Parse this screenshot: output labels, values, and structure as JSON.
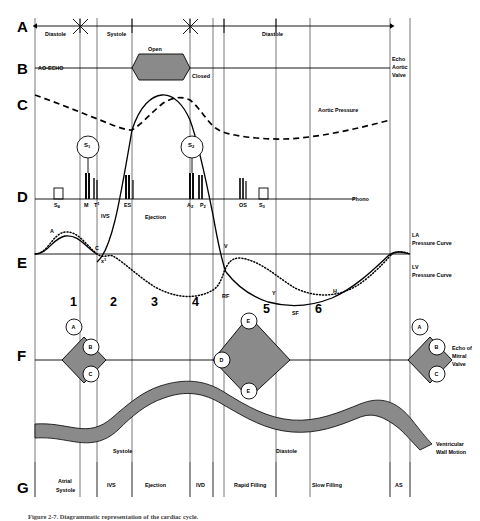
{
  "figure": {
    "caption": "Figure 2-7.  Diagrammatic representation of the cardiac cycle."
  },
  "colors": {
    "line": "#000000",
    "grid": "#555555",
    "fill_gray": "#8a8a8a",
    "fill_band": "#8a8a8a",
    "background": "#ffffff"
  },
  "row_letters": [
    {
      "letter": "A",
      "y": 26
    },
    {
      "letter": "B",
      "y": 68
    },
    {
      "letter": "C",
      "y": 104
    },
    {
      "letter": "D",
      "y": 196
    },
    {
      "letter": "E",
      "y": 262
    },
    {
      "letter": "F",
      "y": 355
    },
    {
      "letter": "G",
      "y": 487
    }
  ],
  "row_a": {
    "name": "timing-bar",
    "segments": [
      {
        "label": "Diastole",
        "x": 45
      },
      {
        "label": "Systole",
        "x": 107
      },
      {
        "label": "Diastole",
        "x": 262
      }
    ]
  },
  "row_b": {
    "left_label": "AO-ECHO",
    "valve_open_label": "Open",
    "valve_closed_label": "Closed",
    "right_label_lines": [
      "Echo",
      "Aortic",
      "Valve"
    ]
  },
  "row_c": {
    "aortic_pressure_label": "Aortic Pressure"
  },
  "row_d": {
    "phono_label": "Phono",
    "heart_sounds": [
      {
        "id": "s1",
        "label": "S",
        "subscript": "1"
      },
      {
        "id": "s2",
        "label": "S",
        "subscript": "2"
      }
    ],
    "markers": [
      {
        "label": "S",
        "subscript": "4",
        "x": 57
      },
      {
        "label": "M",
        "subscript": "",
        "x": 88
      },
      {
        "label": "T",
        "superscript": "1",
        "x": 98
      },
      {
        "label": "ES",
        "subscript": "",
        "x": 128
      },
      {
        "label": "A",
        "subscript": "2",
        "x": 192
      },
      {
        "label": "P",
        "subscript": "2",
        "x": 206
      },
      {
        "label": "OS",
        "subscript": "",
        "x": 243
      },
      {
        "label": "S",
        "subscript": "3",
        "x": 263
      }
    ]
  },
  "row_e": {
    "wave_labels": [
      {
        "label": "A",
        "x": 50,
        "y": 228
      },
      {
        "label": "C",
        "x": 95,
        "y": 245
      },
      {
        "label": "x",
        "superscript": "1",
        "x": 103,
        "y": 258
      },
      {
        "label": "V",
        "x": 224,
        "y": 244
      },
      {
        "label": "Y",
        "x": 272,
        "y": 290
      },
      {
        "label": "H",
        "x": 333,
        "y": 288
      }
    ],
    "right_labels": [
      {
        "lines": [
          "LA",
          "Pressure Curve"
        ],
        "y": 232
      },
      {
        "lines": [
          "LV",
          "Pressure Curve"
        ],
        "y": 262
      }
    ]
  },
  "row_f": {
    "phases": [
      {
        "number": "1",
        "x": 72,
        "y": 302
      },
      {
        "number": "2",
        "x": 112,
        "y": 302
      },
      {
        "number": "3",
        "x": 153,
        "y": 302
      },
      {
        "number": "4",
        "x": 194,
        "y": 302
      },
      {
        "number": "5",
        "x": 265,
        "y": 308
      },
      {
        "number": "6",
        "x": 317,
        "y": 308
      }
    ],
    "filling_labels": [
      {
        "label": "RF",
        "x": 224,
        "y": 295
      },
      {
        "label": "SF",
        "x": 294,
        "y": 312
      }
    ],
    "valve_points_left": [
      {
        "label": "A",
        "cx": 74,
        "cy": 327
      },
      {
        "label": "B",
        "cx": 91,
        "cy": 347
      },
      {
        "label": "C",
        "cx": 91,
        "cy": 374
      }
    ],
    "valve_points_mid": [
      {
        "label": "D",
        "cx": 222,
        "cy": 360
      },
      {
        "label": "E",
        "cx": 249,
        "cy": 321
      },
      {
        "label": "E",
        "cx": 249,
        "cy": 391
      }
    ],
    "valve_points_right": [
      {
        "label": "A",
        "cx": 420,
        "cy": 327
      },
      {
        "label": "B",
        "cx": 437,
        "cy": 347
      },
      {
        "label": "C",
        "cx": 437,
        "cy": 374
      }
    ],
    "right_label_lines": [
      "Echo of",
      "Mitral",
      "Valve"
    ]
  },
  "row_g": {
    "inner_labels": [
      {
        "label": "Systole",
        "x": 118,
        "y": 452
      },
      {
        "label": "Diastole",
        "x": 280,
        "y": 452
      }
    ],
    "right_label_lines": [
      "Ventricular",
      "Wall Motion"
    ],
    "bottom_labels": [
      {
        "lines": [
          "Atrial",
          "Systole"
        ],
        "x": 67
      },
      {
        "lines": [
          "IVS"
        ],
        "x": 110
      },
      {
        "lines": [
          "Ejection"
        ],
        "x": 155
      },
      {
        "lines": [
          "IVD"
        ],
        "x": 199
      },
      {
        "lines": [
          "Rapid Filling"
        ],
        "x": 253
      },
      {
        "lines": [
          "Slow Filling"
        ],
        "x": 327
      },
      {
        "lines": [
          "AS"
        ],
        "x": 398
      }
    ]
  },
  "misc_labels": {
    "ivs": "IVS",
    "ejection": "Ejection"
  },
  "gridlines_x": [
    35,
    80,
    97,
    132,
    190,
    213,
    224,
    276,
    310,
    390,
    410,
    450
  ],
  "frame": {
    "left": 35,
    "right": 450,
    "top": 18,
    "bottom": 497
  }
}
